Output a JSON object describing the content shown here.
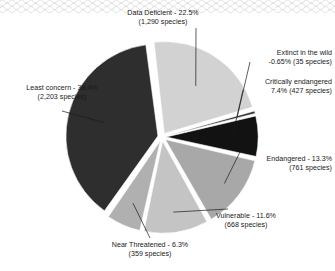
{
  "decoration": {
    "top_border_name": "scalloped-wave-border",
    "wave_color": "#d8d8d8"
  },
  "chart_data": {
    "type": "pie",
    "title": "",
    "subtitle": "",
    "xlabel": "",
    "ylabel": "",
    "legend_position": "none",
    "grid": false,
    "exploded": true,
    "start_angle_deg": -7,
    "direction": "clockwise",
    "total_species": 5743,
    "categories": [
      "Data Deficient",
      "Extinct in the wild",
      "Critically endangered",
      "Endangered",
      "Vulnerable",
      "Near Threatened",
      "Least concern"
    ],
    "values": [
      22.5,
      0.65,
      7.4,
      13.3,
      11.6,
      6.3,
      38.4
    ],
    "counts": [
      1290,
      35,
      427,
      761,
      668,
      359,
      2203
    ],
    "colors": [
      "#d2d2d2",
      "#3a3a3a",
      "#121212",
      "#a8a8a8",
      "#c4c4c4",
      "#b0b0b0",
      "#2e2e2e"
    ],
    "slices": [
      {
        "name": "Data Deficient",
        "percent": 22.5,
        "count": 1290,
        "color": "#d2d2d2",
        "label_line1": "Data Deficient - 22.5%",
        "label_line2": "(1,290 species)"
      },
      {
        "name": "Extinct in the wild",
        "percent": 0.65,
        "count": 35,
        "color": "#3a3a3a",
        "label_line1": "Extinct in the wild",
        "label_line2": "-0.65% (35 species)"
      },
      {
        "name": "Critically endangered",
        "percent": 7.4,
        "count": 427,
        "color": "#121212",
        "label_line1": "Critically endangered",
        "label_line2": "7.4% (427 species)"
      },
      {
        "name": "Endangered",
        "percent": 13.3,
        "count": 761,
        "color": "#a8a8a8",
        "label_line1": "Endangered - 13.3%",
        "label_line2": "(761 species)"
      },
      {
        "name": "Vulnerable",
        "percent": 11.6,
        "count": 668,
        "color": "#c4c4c4",
        "label_line1": "Vulnerable - 11.6%",
        "label_line2": "(668 species)"
      },
      {
        "name": "Near Threatened",
        "percent": 6.3,
        "count": 359,
        "color": "#b0b0b0",
        "label_line1": "Near Threatened - 6.3%",
        "label_line2": "(359 species)"
      },
      {
        "name": "Least concern",
        "percent": 38.4,
        "count": 2203,
        "color": "#2e2e2e",
        "label_line1": "Least concern - 38.4%",
        "label_line2": "(2,203 species)"
      }
    ]
  }
}
